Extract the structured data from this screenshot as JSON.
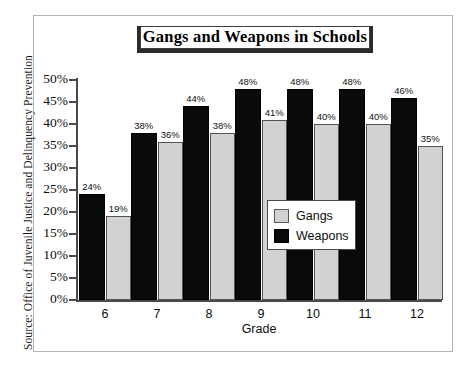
{
  "figure": {
    "source_note": "Source: Office of Juvenile Justice and Delinquency Prevention",
    "frame_color": "#b4b4b4"
  },
  "chart_data": {
    "type": "bar",
    "title": "Gangs and Weapons in Schools",
    "xlabel": "Grade",
    "ylabel": "",
    "categories": [
      "6",
      "7",
      "8",
      "9",
      "10",
      "11",
      "12"
    ],
    "series": [
      {
        "name": "Weapons",
        "color": "#0a0a0a",
        "values": [
          24,
          38,
          44,
          48,
          48,
          48,
          46
        ],
        "labels": [
          "24%",
          "38%",
          "44%",
          "48%",
          "48%",
          "48%",
          "46%"
        ]
      },
      {
        "name": "Gangs",
        "color": "#d2d2d2",
        "values": [
          19,
          36,
          38,
          41,
          40,
          40,
          35
        ],
        "labels": [
          "19%",
          "36%",
          "38%",
          "41%",
          "40%",
          "40%",
          "35%"
        ]
      }
    ],
    "ylim": [
      0,
      50
    ],
    "ytick_values": [
      0,
      5,
      10,
      15,
      20,
      25,
      30,
      35,
      40,
      45,
      50
    ],
    "ytick_labels": [
      "0%",
      "5%",
      "10%",
      "15%",
      "20%",
      "25%",
      "30%",
      "35%",
      "40%",
      "45%",
      "50%"
    ],
    "grid": false,
    "legend_position": "center-right",
    "legend_entries": [
      {
        "label": "Gangs",
        "color": "#d2d2d2"
      },
      {
        "label": "Weapons",
        "color": "#0a0a0a"
      }
    ]
  }
}
